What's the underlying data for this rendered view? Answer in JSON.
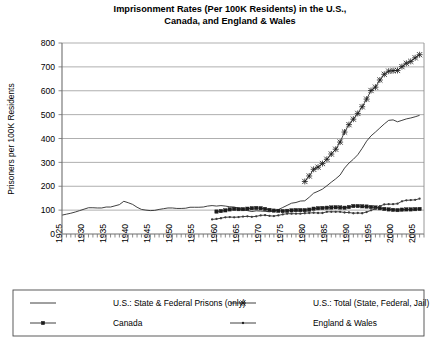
{
  "chart_data": {
    "type": "line",
    "title": "Imprisonment Rates (Per 100K Residents) in the U.S., Canada, and England & Wales",
    "title_line1": "Imprisonment Rates (Per 100K Residents) in the U.S.,",
    "title_line2": "Canada, and England & Wales",
    "xlabel": "",
    "ylabel": "Prisoners per 100K Residents",
    "xlim": [
      1925,
      2007
    ],
    "ylim": [
      0,
      800
    ],
    "ytick_labels": [
      "0",
      "100",
      "200",
      "300",
      "400",
      "500",
      "600",
      "700",
      "800"
    ],
    "ytick_values": [
      0,
      100,
      200,
      300,
      400,
      500,
      600,
      700,
      800
    ],
    "xtick_labels": [
      "1925",
      "1930",
      "1935",
      "1940",
      "1945",
      "1950",
      "1955",
      "1960",
      "1965",
      "1970",
      "1975",
      "1980",
      "1985",
      "1990",
      "1995",
      "2000",
      "2005"
    ],
    "xtick_values": [
      1925,
      1930,
      1935,
      1940,
      1945,
      1950,
      1955,
      1960,
      1965,
      1970,
      1975,
      1980,
      1985,
      1990,
      1995,
      2000,
      2005
    ],
    "minor_tick_interval": 1,
    "grid": "horizontal",
    "legend_position": "bottom",
    "series": [
      {
        "name": "U.S.: State & Federal Prisons (only)",
        "marker": "none",
        "color": "#2b2b2b",
        "x": [
          1925,
          1926,
          1927,
          1928,
          1929,
          1930,
          1931,
          1932,
          1933,
          1934,
          1935,
          1936,
          1937,
          1938,
          1939,
          1940,
          1941,
          1942,
          1943,
          1944,
          1945,
          1946,
          1947,
          1948,
          1949,
          1950,
          1951,
          1952,
          1953,
          1954,
          1955,
          1956,
          1957,
          1958,
          1959,
          1960,
          1961,
          1962,
          1963,
          1964,
          1965,
          1966,
          1967,
          1968,
          1969,
          1970,
          1971,
          1972,
          1973,
          1974,
          1975,
          1976,
          1977,
          1978,
          1979,
          1980,
          1981,
          1982,
          1983,
          1984,
          1985,
          1986,
          1987,
          1988,
          1989,
          1990,
          1991,
          1992,
          1993,
          1994,
          1995,
          1996,
          1997,
          1998,
          1999,
          2000,
          2001,
          2002,
          2003,
          2004,
          2005,
          2006
        ],
        "y": [
          79,
          83,
          87,
          92,
          98,
          104,
          110,
          110,
          109,
          109,
          113,
          113,
          118,
          123,
          137,
          131,
          124,
          112,
          103,
          100,
          98,
          99,
          103,
          106,
          109,
          109,
          107,
          107,
          108,
          112,
          112,
          112,
          113,
          117,
          119,
          117,
          119,
          117,
          114,
          113,
          108,
          102,
          98,
          94,
          97,
          96,
          95,
          93,
          96,
          102,
          111,
          120,
          129,
          132,
          138,
          139,
          154,
          171,
          179,
          188,
          202,
          217,
          231,
          247,
          276,
          297,
          313,
          332,
          359,
          389,
          411,
          427,
          444,
          461,
          476,
          478,
          470,
          476,
          482,
          486,
          491,
          497
        ]
      },
      {
        "name": "U.S.: Total (State, Federal, Jail)",
        "marker": "x",
        "color": "#1c1c1c",
        "x": [
          1980,
          1981,
          1982,
          1983,
          1984,
          1985,
          1986,
          1987,
          1988,
          1989,
          1990,
          1991,
          1992,
          1993,
          1994,
          1995,
          1996,
          1997,
          1998,
          1999,
          2000,
          2001,
          2002,
          2003,
          2004,
          2005,
          2006
        ],
        "y": [
          220,
          243,
          271,
          280,
          295,
          313,
          335,
          355,
          385,
          427,
          458,
          481,
          505,
          533,
          565,
          601,
          615,
          645,
          669,
          682,
          684,
          685,
          701,
          715,
          723,
          738,
          751
        ]
      },
      {
        "name": "Canada",
        "marker": "square",
        "color": "#1c1c1c",
        "x": [
          1960,
          1961,
          1962,
          1963,
          1964,
          1965,
          1966,
          1967,
          1968,
          1969,
          1970,
          1971,
          1972,
          1973,
          1974,
          1975,
          1976,
          1977,
          1978,
          1979,
          1980,
          1981,
          1982,
          1983,
          1984,
          1985,
          1986,
          1987,
          1988,
          1989,
          1990,
          1991,
          1992,
          1993,
          1994,
          1995,
          1996,
          1997,
          1998,
          1999,
          2000,
          2001,
          2002,
          2003,
          2004,
          2005,
          2006
        ],
        "y": [
          94,
          96,
          99,
          103,
          105,
          104,
          104,
          106,
          108,
          109,
          108,
          105,
          101,
          98,
          97,
          96,
          97,
          99,
          100,
          100,
          100,
          102,
          106,
          108,
          109,
          110,
          111,
          112,
          111,
          110,
          113,
          117,
          117,
          116,
          115,
          113,
          111,
          108,
          105,
          103,
          101,
          100,
          102,
          103,
          103,
          104,
          105
        ]
      },
      {
        "name": "England & Wales",
        "marker": "dot",
        "color": "#3a3a3a",
        "x": [
          1959,
          1960,
          1961,
          1962,
          1963,
          1964,
          1965,
          1966,
          1967,
          1968,
          1969,
          1970,
          1971,
          1972,
          1973,
          1974,
          1975,
          1976,
          1977,
          1978,
          1979,
          1980,
          1981,
          1982,
          1983,
          1984,
          1985,
          1986,
          1987,
          1988,
          1989,
          1990,
          1991,
          1992,
          1993,
          1994,
          1995,
          1996,
          1997,
          1998,
          1999,
          2000,
          2001,
          2002,
          2003,
          2004,
          2005,
          2006
        ],
        "y": [
          61,
          63,
          66,
          70,
          71,
          70,
          71,
          73,
          74,
          72,
          74,
          78,
          79,
          76,
          75,
          78,
          82,
          85,
          85,
          85,
          85,
          87,
          88,
          89,
          88,
          88,
          93,
          93,
          93,
          93,
          90,
          90,
          87,
          88,
          87,
          92,
          99,
          106,
          117,
          124,
          125,
          125,
          127,
          137,
          141,
          142,
          143,
          148
        ]
      }
    ]
  },
  "legend": {
    "entries": [
      {
        "label": "U.S.: State & Federal Prisons (only)",
        "marker": "none"
      },
      {
        "label": "U.S.: Total (State, Federal, Jail)",
        "marker": "x"
      },
      {
        "label": "Canada",
        "marker": "square"
      },
      {
        "label": "England & Wales",
        "marker": "dot"
      }
    ]
  }
}
